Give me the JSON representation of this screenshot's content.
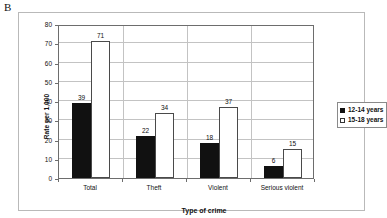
{
  "panel": {
    "letter": "B"
  },
  "chart_data": {
    "type": "bar",
    "title": "",
    "subtitle": "",
    "xlabel": "Type of crime",
    "ylabel": "Rate per 1,000",
    "categories": [
      "Total",
      "Theft",
      "Violent",
      "Serious violent"
    ],
    "series": [
      {
        "name": "12-14 years",
        "values": [
          39,
          22,
          18,
          6
        ],
        "color": "#111111",
        "fill": "solid"
      },
      {
        "name": "15-18 years",
        "values": [
          71,
          34,
          37,
          15
        ],
        "color": "#ffffff",
        "fill": "outline"
      }
    ],
    "ylim": [
      0,
      80
    ],
    "ytick_labels": [
      "0",
      "10",
      "20",
      "30",
      "40",
      "50",
      "60",
      "70",
      "80"
    ],
    "ytick_values": [
      0,
      10,
      20,
      30,
      40,
      50,
      60,
      70,
      80
    ],
    "grid": "horizontal",
    "data_labels": true,
    "legend_position": "right",
    "legend_entries": [
      "12-14 years",
      "15-18 years"
    ]
  }
}
